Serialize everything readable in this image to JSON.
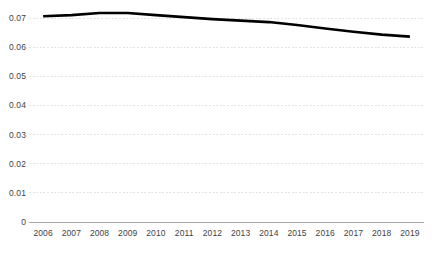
{
  "chart_data": {
    "type": "line",
    "title": "",
    "subtitle": "",
    "xlabel": "",
    "ylabel": "",
    "categories": [
      "2006",
      "2007",
      "2008",
      "2009",
      "2010",
      "2011",
      "2012",
      "2013",
      "2014",
      "2015",
      "2016",
      "2017",
      "2018",
      "2019"
    ],
    "values": [
      0.0706,
      0.071,
      0.0717,
      0.0717,
      0.071,
      0.0703,
      0.0696,
      0.0691,
      0.0686,
      0.0676,
      0.0664,
      0.0653,
      0.0643,
      0.0636
    ],
    "series": [
      {
        "name": "series-1",
        "values": [
          0.0706,
          0.071,
          0.0717,
          0.0717,
          0.071,
          0.0703,
          0.0696,
          0.0691,
          0.0686,
          0.0676,
          0.0664,
          0.0653,
          0.0643,
          0.0636
        ],
        "color": "#000000"
      }
    ],
    "ylim": [
      0,
      0.07
    ],
    "ytick_labels": [
      "0",
      "0.01",
      "0.02",
      "0.03",
      "0.04",
      "0.05",
      "0.06",
      "0.07"
    ],
    "ytick_values": [
      0,
      0.01,
      0.02,
      0.03,
      0.04,
      0.05,
      0.06,
      0.07
    ],
    "grid": true,
    "grid_axis": "y",
    "grid_color": "#e4e4e4",
    "axis_line_color": "#a6a6a6",
    "legend": false,
    "legend_position": "none",
    "annotations": []
  },
  "colors": {
    "line": "#000000",
    "grid": "#e4e4e4",
    "axis": "#a6a6a6",
    "tick_text": "#3f3f3f",
    "background": "#ffffff"
  }
}
